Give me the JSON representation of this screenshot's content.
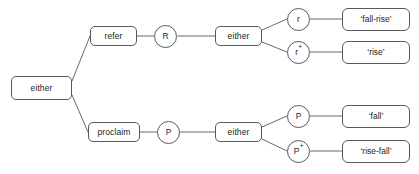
{
  "diagram": {
    "type": "decision-tree",
    "title": "",
    "background_color": "#ffffff",
    "line_color": "#58595b",
    "text_color": "#231f20",
    "nodes": {
      "root": {
        "label": "either",
        "shape": "rounded-box"
      },
      "refer": {
        "label": "refer",
        "shape": "rounded-box"
      },
      "proclaim": {
        "label": "proclaim",
        "shape": "rounded-box"
      },
      "r_op": {
        "label": "R",
        "shape": "circle"
      },
      "p_op": {
        "label": "P",
        "shape": "circle"
      },
      "either_upper": {
        "label": "either",
        "shape": "rounded-box"
      },
      "either_lower": {
        "label": "either",
        "shape": "rounded-box"
      },
      "r_plain": {
        "label": "r",
        "sup": "",
        "shape": "circle"
      },
      "r_plus": {
        "label": "r",
        "sup": "+",
        "shape": "circle"
      },
      "p_plain": {
        "label": "P",
        "sup": "",
        "shape": "circle"
      },
      "p_plus": {
        "label": "P",
        "sup": "+",
        "shape": "circle"
      },
      "fall_rise": {
        "label": "‘fall-rise’",
        "shape": "rounded-box"
      },
      "rise": {
        "label": "‘rise’",
        "shape": "rounded-box"
      },
      "fall": {
        "label": "‘fall’",
        "shape": "rounded-box"
      },
      "rise_fall": {
        "label": "‘rise-fall’",
        "shape": "rounded-box"
      }
    },
    "edges": [
      {
        "from": "root",
        "to": "refer"
      },
      {
        "from": "root",
        "to": "proclaim"
      },
      {
        "from": "refer",
        "to": "r_op"
      },
      {
        "from": "r_op",
        "to": "either_upper"
      },
      {
        "from": "either_upper",
        "to": "r_plain"
      },
      {
        "from": "either_upper",
        "to": "r_plus"
      },
      {
        "from": "r_plain",
        "to": "fall_rise"
      },
      {
        "from": "r_plus",
        "to": "rise"
      },
      {
        "from": "proclaim",
        "to": "p_op"
      },
      {
        "from": "p_op",
        "to": "either_lower"
      },
      {
        "from": "either_lower",
        "to": "p_plain"
      },
      {
        "from": "either_lower",
        "to": "p_plus"
      },
      {
        "from": "p_plain",
        "to": "fall"
      },
      {
        "from": "p_plus",
        "to": "rise_fall"
      }
    ]
  }
}
